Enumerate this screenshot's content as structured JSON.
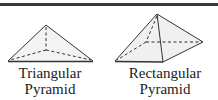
{
  "figures": [
    {
      "name": "triangular-pyramid",
      "label_line1": "Triangular",
      "label_line2": "Pyramid"
    },
    {
      "name": "rectangular-pyramid",
      "label_line1": "Rectangular",
      "label_line2": "Pyramid"
    }
  ],
  "colors": {
    "edge": "#333333",
    "face": "#f2f2f2",
    "bar": "#3a3a3a"
  }
}
